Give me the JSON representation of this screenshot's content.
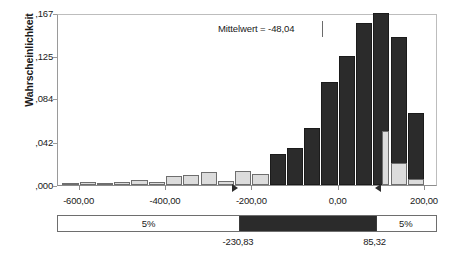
{
  "chart_data": {
    "type": "bar",
    "title": "",
    "subtitle": "",
    "xlabel": "",
    "ylabel": "Wahrscheinlichkeit",
    "xlim": [
      -650,
      230
    ],
    "ylim": [
      0.0,
      0.167
    ],
    "grid": false,
    "legend": "none",
    "x_tick_labels": [
      "-600,00",
      "-400,00",
      "-200,00",
      "0,00",
      "200,00"
    ],
    "x_tick_values": [
      -600,
      -400,
      -200,
      0,
      200
    ],
    "y_tick_labels": [
      ",000",
      ",042",
      ",084",
      ",125",
      ",167"
    ],
    "y_tick_values": [
      0.0,
      0.042,
      0.084,
      0.125,
      0.167
    ],
    "bin_width": 40,
    "bin_centers": [
      -620,
      -580,
      -540,
      -500,
      -460,
      -420,
      -380,
      -340,
      -300,
      -260,
      -220,
      -180,
      -140,
      -100,
      -60,
      -20,
      20,
      60,
      100,
      140,
      180
    ],
    "values": [
      0.0005,
      0.0025,
      0.0005,
      0.003,
      0.005,
      0.003,
      0.009,
      0.01,
      0.013,
      0.004,
      0.014,
      0.011,
      0.03,
      0.036,
      0.055,
      0.1,
      0.125,
      0.157,
      0.167,
      0.144,
      0.07
    ],
    "bar_colors": [
      "light",
      "light",
      "light",
      "light",
      "light",
      "light",
      "light",
      "light",
      "light",
      "light",
      "light",
      "light",
      "dark",
      "dark",
      "dark",
      "dark",
      "dark",
      "dark",
      "dark",
      "dark",
      "dark"
    ],
    "extra_bins": {
      "centers": [
        100,
        140,
        180
      ],
      "values": [
        0.052,
        0.021,
        0.006
      ],
      "colors": [
        "light",
        "light",
        "light"
      ]
    },
    "annotations": [
      {
        "name": "mean-label",
        "text": "Mittelwert = -48,04",
        "value": -48.04
      }
    ],
    "markers": [
      {
        "name": "lower-bound-marker",
        "value": -230.83,
        "direction": "right"
      },
      {
        "name": "upper-bound-marker",
        "value": 85.32,
        "direction": "left"
      }
    ]
  },
  "axes": {
    "y_title": "Wahrscheinlichkeit",
    "y_ticks": [
      {
        "label": ",167",
        "value": 0.167
      },
      {
        "label": ",125",
        "value": 0.125
      },
      {
        "label": ",084",
        "value": 0.084
      },
      {
        "label": ",042",
        "value": 0.042
      },
      {
        "label": ",000",
        "value": 0.0
      }
    ],
    "x_ticks": [
      {
        "label": "-600,00",
        "value": -600
      },
      {
        "label": "-400,00",
        "value": -400
      },
      {
        "label": "-200,00",
        "value": -200
      },
      {
        "label": "0,00",
        "value": 0
      },
      {
        "label": "200,00",
        "value": 200
      }
    ]
  },
  "annotation": {
    "mean_text": "Mittelwert = -48,04"
  },
  "confidence_strip": {
    "left_tail_label": "5%",
    "right_tail_label": "5%",
    "lower_bound_label": "-230,83",
    "upper_bound_label": "85,32",
    "lower_bound_value": -230.83,
    "upper_bound_value": 85.32
  },
  "colors": {
    "bar_dark": "#2b2b2b",
    "bar_light": "#dcdcdc",
    "bar_light_edge": "#6e6e6e",
    "axis": "#8c8c8c",
    "text": "#1a1a1a"
  }
}
